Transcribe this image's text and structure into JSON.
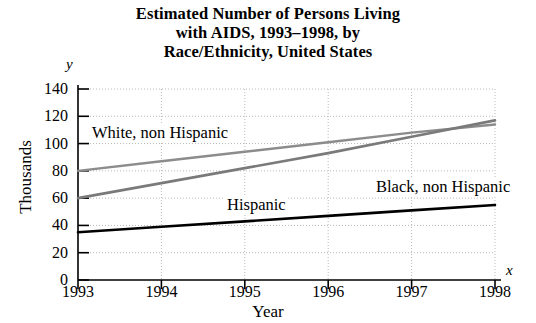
{
  "title_lines": [
    "Estimated Number of Persons Living",
    "with AIDS, 1993–1998, by",
    "Race/Ethnicity, United States"
  ],
  "axis_letters": {
    "y": "y",
    "x": "x"
  },
  "chart_data": {
    "type": "line",
    "title": "Estimated Number of Persons Living with AIDS, 1993–1998, by Race/Ethnicity, United States",
    "xlabel": "Year",
    "ylabel": "Thousands",
    "categories": [
      "1993",
      "1994",
      "1995",
      "1996",
      "1997",
      "1998"
    ],
    "x": [
      1993,
      1994,
      1995,
      1996,
      1997,
      1998
    ],
    "xlim": [
      1993,
      1998
    ],
    "ylim": [
      0,
      140
    ],
    "yticks": [
      0,
      20,
      40,
      60,
      80,
      100,
      120,
      140
    ],
    "xticks": [
      "1993",
      "1994",
      "1995",
      "1996",
      "1997",
      "1998"
    ],
    "grid": true,
    "legend": "inline-labels",
    "series": [
      {
        "name": "White, non Hispanic",
        "color": "#8c8c8c",
        "width": 2.4,
        "values": [
          80,
          87,
          94,
          101,
          108,
          114
        ],
        "label_position": "upper-left"
      },
      {
        "name": "Black, non Hispanic",
        "color": "#7a7a7a",
        "width": 2.6,
        "values": [
          60,
          71,
          82,
          93,
          105,
          117
        ],
        "label_position": "lower-right"
      },
      {
        "name": "Hispanic",
        "color": "#000000",
        "width": 2.6,
        "values": [
          35,
          39,
          43,
          47,
          51,
          55
        ],
        "label_position": "above-line-center"
      }
    ]
  }
}
